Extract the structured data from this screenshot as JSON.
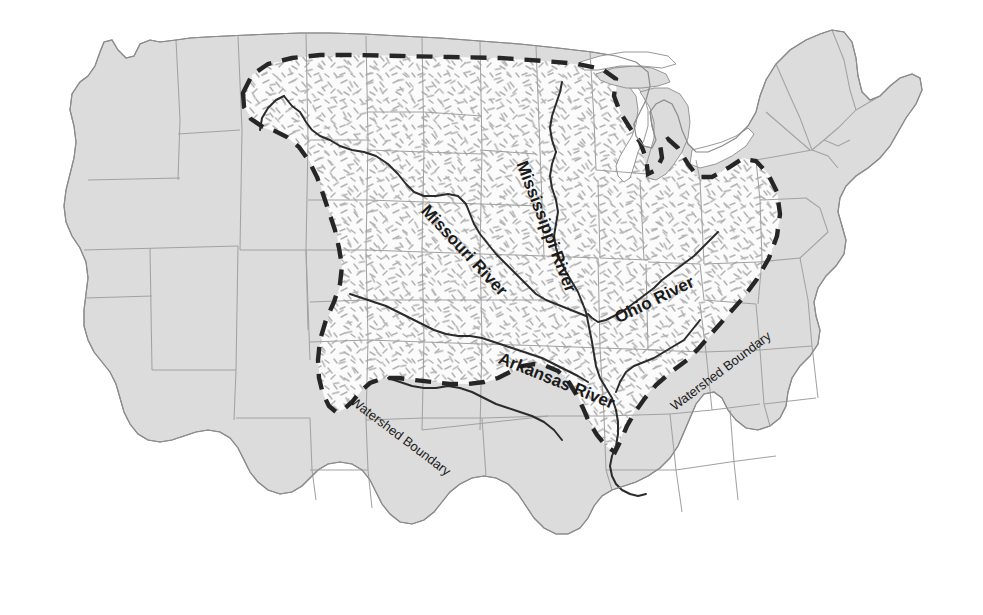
{
  "map": {
    "title": "Mississippi River Watershed Map of the United States",
    "background_color": "#ffffff",
    "outside_watershed_fill": "#dcdcdc",
    "inside_watershed_fill": "#fbfbfb",
    "state_border_color": "#9a9a9a",
    "coast_border_color": "#8c8c8c",
    "river_color": "#2b2b2b",
    "watershed_boundary_color": "#262626",
    "hatch_color": "#b0b0b0"
  },
  "labels": {
    "rivers": [
      {
        "name": "missouri-river",
        "text": "Missouri River",
        "x": 424,
        "y": 198,
        "rotate": 47,
        "size": 17
      },
      {
        "name": "mississippi-river",
        "text": "Mississippi River",
        "x": 521,
        "y": 152,
        "rotate": 69,
        "size": 17
      },
      {
        "name": "ohio-river",
        "text": "Ohio River",
        "x": 616,
        "y": 309,
        "rotate": -26,
        "size": 17
      },
      {
        "name": "arkansas-river",
        "text": "Arkansas River",
        "x": 499,
        "y": 348,
        "rotate": 22,
        "size": 17
      }
    ],
    "watershed": [
      {
        "name": "watershed-boundary-southwest",
        "text": "Watershed Boundary",
        "x": 352,
        "y": 392,
        "rotate": 37,
        "size": 13
      },
      {
        "name": "watershed-boundary-southeast",
        "text": "Watershed Boundary",
        "x": 672,
        "y": 400,
        "rotate": -37,
        "size": 13
      }
    ]
  },
  "legend": {
    "watershed_boundary_label": "Watershed Boundary",
    "inside_label": "Mississippi River Watershed",
    "outside_label": "Outside Watershed"
  }
}
